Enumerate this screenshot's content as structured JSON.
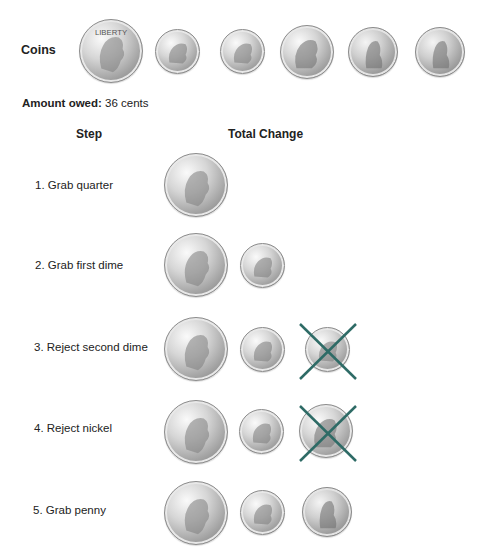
{
  "coins_row": {
    "label": "Coins",
    "items": [
      {
        "type": "quarter",
        "icon": "quarter-coin-icon"
      },
      {
        "type": "dime",
        "icon": "dime-coin-icon"
      },
      {
        "type": "dime",
        "icon": "dime-coin-icon"
      },
      {
        "type": "nickel",
        "icon": "nickel-coin-icon"
      },
      {
        "type": "penny",
        "icon": "penny-coin-icon"
      },
      {
        "type": "penny",
        "icon": "penny-coin-icon"
      }
    ]
  },
  "amount_owed": {
    "label": "Amount owed:",
    "value": "36 cents"
  },
  "table": {
    "headers": {
      "step": "Step",
      "total_change": "Total Change"
    },
    "steps": [
      {
        "label": "1. Grab quarter",
        "coins": [
          "quarter"
        ],
        "rejected": null
      },
      {
        "label": "2. Grab first dime",
        "coins": [
          "quarter",
          "dime"
        ],
        "rejected": null
      },
      {
        "label": "3. Reject second dime",
        "coins": [
          "quarter",
          "dime"
        ],
        "rejected": "dime"
      },
      {
        "label": "4. Reject nickel",
        "coins": [
          "quarter",
          "dime"
        ],
        "rejected": "nickel"
      },
      {
        "label": "5. Grab penny",
        "coins": [
          "quarter",
          "dime",
          "penny"
        ],
        "rejected": null
      }
    ]
  },
  "colors": {
    "reject_x": "#2e6b66",
    "text": "#222222",
    "background": "#ffffff"
  }
}
